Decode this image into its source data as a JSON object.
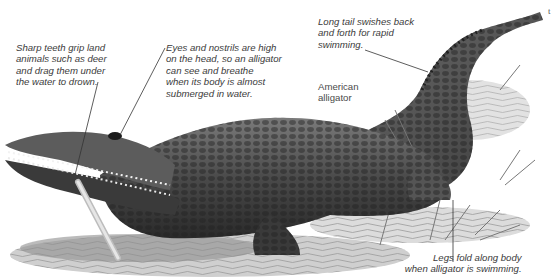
{
  "illustration": {
    "subject_label": "American\nalligator",
    "subject_label_lines": [
      "American",
      "alligator"
    ],
    "callouts": [
      {
        "id": "teeth",
        "lines": [
          "Sharp teeth grip land",
          "animals such as deer",
          "and drag them under",
          "the water to drown."
        ]
      },
      {
        "id": "eyes",
        "lines": [
          "Eyes and nostrils are high",
          "on the head, so an alligator",
          "can see and breathe",
          "when its body is almost",
          "submerged in water."
        ]
      },
      {
        "id": "tail",
        "lines": [
          "Long tail swishes back",
          "and forth for rapid",
          "swimming."
        ]
      },
      {
        "id": "legs",
        "lines": [
          "Legs fold along body",
          "when alligator is swimming."
        ]
      }
    ],
    "edge_fragment": "t",
    "colors": {
      "text": "#3a3a3a",
      "leader": "#333333",
      "body_dark": "#2e2e2e",
      "body_mid": "#6b6b6b",
      "water": "#bdbdbd",
      "background": "#ffffff"
    }
  }
}
